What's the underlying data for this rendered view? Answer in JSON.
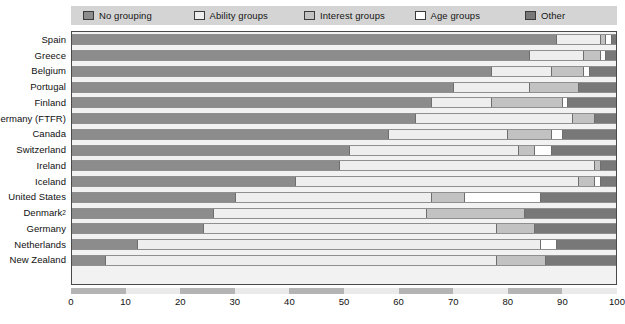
{
  "legend": {
    "items": [
      {
        "label": "No grouping",
        "color": "#8c8c8c",
        "swatch_name": "legend-swatch-no-grouping"
      },
      {
        "label": "Ability groups",
        "color": "#eeeeee",
        "swatch_name": "legend-swatch-ability-groups"
      },
      {
        "label": "Interest groups",
        "color": "#c2c2c2",
        "swatch_name": "legend-swatch-interest-groups"
      },
      {
        "label": "Age groups",
        "color": "#ffffff",
        "swatch_name": "legend-swatch-age-groups"
      },
      {
        "label": "Other",
        "color": "#787878",
        "swatch_name": "legend-swatch-other"
      }
    ],
    "background": "#d4d4d4"
  },
  "axis": {
    "xticks": [
      "0",
      "10",
      "20",
      "30",
      "40",
      "50",
      "60",
      "70",
      "80",
      "90",
      "100"
    ],
    "xmin": 0,
    "xmax": 100
  },
  "footnote": "",
  "chart_data": {
    "type": "bar",
    "orientation": "horizontal",
    "stacked": true,
    "title": "",
    "subtitle": "",
    "xlabel": "",
    "ylabel": "",
    "xlim": [
      0,
      100
    ],
    "grid": false,
    "legend_position": "top",
    "series": [
      {
        "name": "No grouping",
        "color": "#8c8c8c",
        "values": [
          89,
          84,
          77,
          70,
          66,
          63,
          58,
          51,
          49,
          41,
          30,
          26,
          24,
          12,
          6
        ]
      },
      {
        "name": "Ability groups",
        "color": "#eeeeee",
        "values": [
          8,
          10,
          11,
          14,
          11,
          29,
          22,
          31,
          47,
          52,
          36,
          39,
          54,
          74,
          72
        ]
      },
      {
        "name": "Interest groups",
        "color": "#c2c2c2",
        "values": [
          1,
          3,
          6,
          9,
          13,
          4,
          8,
          3,
          1,
          3,
          6,
          18,
          7,
          0,
          9
        ]
      },
      {
        "name": "Age groups",
        "color": "#ffffff",
        "values": [
          1,
          1,
          1,
          0,
          1,
          0,
          2,
          3,
          0,
          1,
          14,
          0,
          0,
          3,
          0
        ]
      },
      {
        "name": "Other",
        "color": "#787878",
        "values": [
          1,
          2,
          5,
          7,
          9,
          4,
          10,
          12,
          3,
          3,
          14,
          17,
          15,
          11,
          13
        ]
      }
    ],
    "categories": [
      "Spain",
      "Greece",
      "Belgium",
      "Portugal",
      "Finland",
      "Germany (FTFR)",
      "Canada",
      "Switzerland",
      "Ireland",
      "Iceland",
      "United States",
      "Denmark",
      "Germany",
      "Netherlands",
      "New Zealand"
    ],
    "category_footnote_markers": {
      "Denmark": "2"
    }
  }
}
